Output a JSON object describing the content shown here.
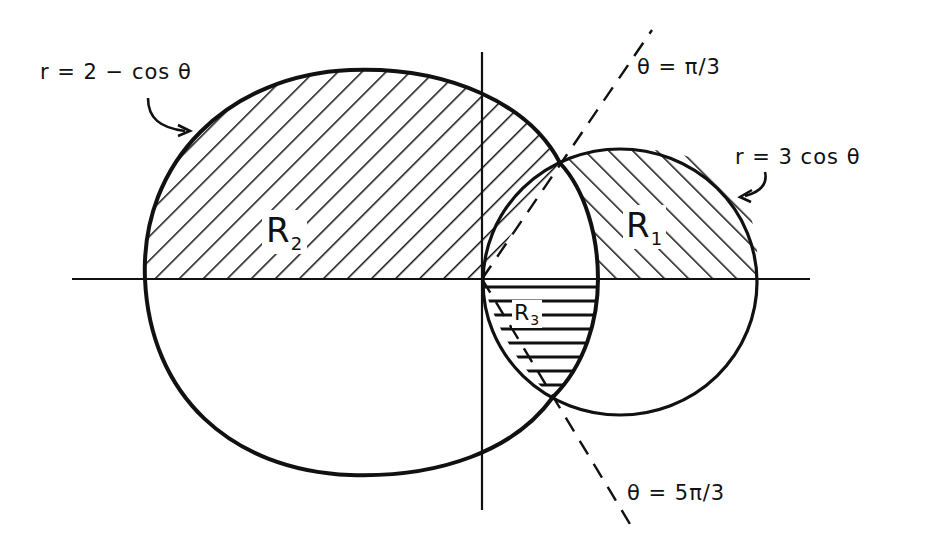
{
  "figure": {
    "curves": [
      {
        "id": "limacon",
        "label": "r = 2 − cos θ"
      },
      {
        "id": "circle",
        "label": "r = 3 cos θ"
      }
    ],
    "rays": [
      {
        "id": "ray-upper",
        "label": "θ = π/3"
      },
      {
        "id": "ray-lower",
        "label": "θ = 5π/3"
      }
    ],
    "regions": [
      {
        "id": "R1",
        "name": "R",
        "sub": "1",
        "hatch": "diagonal-down"
      },
      {
        "id": "R2",
        "name": "R",
        "sub": "2",
        "hatch": "diagonal-up"
      },
      {
        "id": "R3",
        "name": "R",
        "sub": "3",
        "hatch": "horizontal"
      }
    ],
    "colors": {
      "ink": "#111111",
      "background": "#ffffff"
    }
  }
}
